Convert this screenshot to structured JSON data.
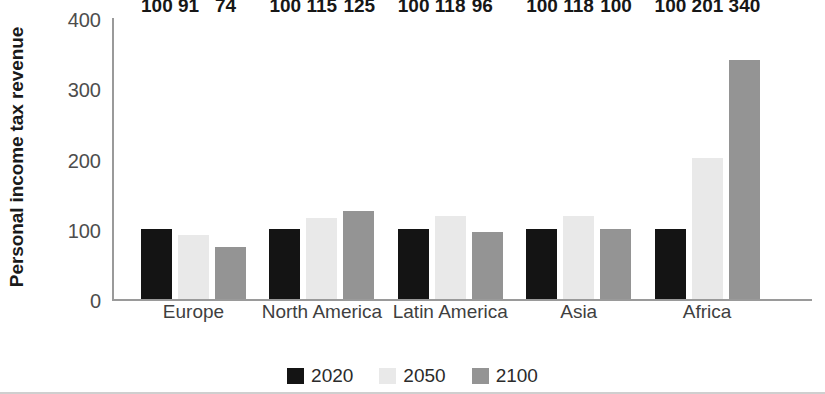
{
  "chart_data": {
    "type": "bar",
    "title": "",
    "subtitle": "",
    "xlabel": "",
    "ylabel": "Personal income tax revenue",
    "ylim": [
      0,
      400
    ],
    "yticks": [
      0,
      100,
      200,
      300,
      400
    ],
    "ytick_labels": [
      "0",
      "100",
      "200",
      "300",
      "400"
    ],
    "grid": false,
    "legend_position": "bottom",
    "categories": [
      "Europe",
      "North America",
      "Latin America",
      "Asia",
      "Africa"
    ],
    "series": [
      {
        "name": "2020",
        "color": "#141414",
        "values": [
          100,
          100,
          100,
          100,
          100
        ],
        "labels": [
          "100",
          "100",
          "100",
          "100",
          "100"
        ]
      },
      {
        "name": "2050",
        "color": "#e9e9e9",
        "values": [
          91,
          115,
          118,
          118,
          201
        ],
        "labels": [
          "91",
          "115",
          "118",
          "118",
          "201"
        ]
      },
      {
        "name": "2100",
        "color": "#949494",
        "values": [
          74,
          125,
          96,
          100,
          340
        ],
        "labels": [
          "74",
          "125",
          "96",
          "100",
          "340"
        ]
      }
    ]
  },
  "legend": {
    "items": [
      {
        "label": "2020",
        "color": "#141414"
      },
      {
        "label": "2050",
        "color": "#e9e9e9"
      },
      {
        "label": "2100",
        "color": "#949494"
      }
    ]
  }
}
